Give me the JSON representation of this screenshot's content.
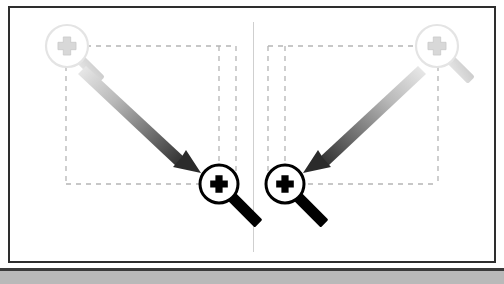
{
  "figure": {
    "title": "Magnifier zoom-in comparison diagram",
    "background_color": "#ffffff",
    "frame_border_color": "#2e2e2e",
    "bottom_band_color": "#b9b9b9",
    "divider_color": "#cfcfcf",
    "panel_count": 2
  },
  "colors": {
    "dark_icon": "#000000",
    "faint_icon": "#e2e2e2",
    "faint_icon_shade": "#d2d2d2",
    "dashed_guide": "#b5b5b5",
    "arrow_start": "#e8e8e8",
    "arrow_end": "#2b2b2b"
  },
  "panels": [
    {
      "id": "panel-left",
      "name": "left-panel",
      "faint_magnifier": {
        "name": "faint-magnifier-left",
        "center_x": 67,
        "center_y": 46,
        "radius": 21,
        "handle_direction": "down-right",
        "glyph": "plus",
        "state": "ghost"
      },
      "dark_magnifier": {
        "name": "dark-magnifier-left",
        "center_x": 219,
        "center_y": 184,
        "radius": 19,
        "handle_direction": "down-right",
        "glyph": "plus",
        "state": "active"
      },
      "arrow": {
        "name": "motion-arrow-left",
        "from_x": 86,
        "from_y": 66,
        "to_x": 200,
        "to_y": 172,
        "direction": "down-right",
        "gradient": "light-to-dark"
      },
      "dashed_rect": {
        "name": "alignment-guides-left",
        "left": 66,
        "top": 46,
        "right": 236,
        "bottom": 184
      }
    },
    {
      "id": "panel-right",
      "name": "right-panel",
      "faint_magnifier": {
        "name": "faint-magnifier-right",
        "center_x": 437,
        "center_y": 46,
        "radius": 21,
        "handle_direction": "down-right",
        "glyph": "plus",
        "state": "ghost"
      },
      "dark_magnifier": {
        "name": "dark-magnifier-right",
        "center_x": 285,
        "center_y": 184,
        "radius": 19,
        "handle_direction": "down-right",
        "glyph": "plus",
        "state": "active"
      },
      "arrow": {
        "name": "motion-arrow-right",
        "from_x": 418,
        "from_y": 66,
        "to_x": 304,
        "to_y": 172,
        "direction": "down-left",
        "gradient": "light-to-dark"
      },
      "dashed_rect": {
        "name": "alignment-guides-right",
        "left": 268,
        "top": 46,
        "right": 438,
        "bottom": 184
      }
    }
  ]
}
